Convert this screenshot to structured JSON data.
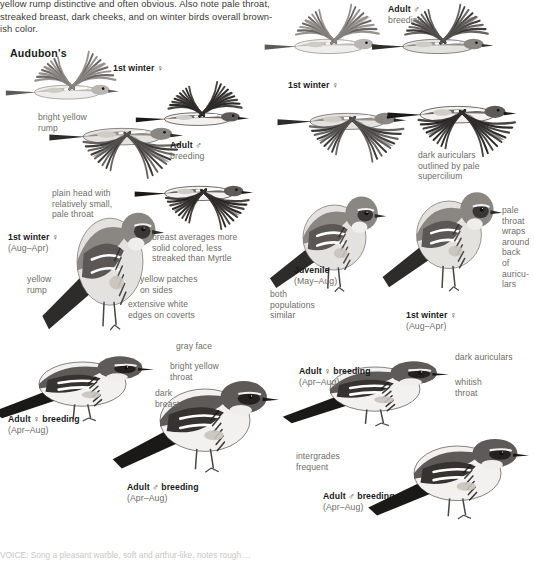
{
  "page": {
    "width": 528,
    "height": 561,
    "background": "#ffffff",
    "ink": "#231f20",
    "label_color": "#6f6c69",
    "heading_color": "#1a1a1a",
    "footer_color": "#c9c7c5"
  },
  "intro": {
    "lines": [
      "yellow rump distinctive and often obvious. Also note pale throat,",
      "streaked breast, dark cheeks, and on winter birds overall brown-",
      "ish color."
    ]
  },
  "headings": [
    {
      "id": "audubons",
      "text": "Audubon's",
      "x": 10,
      "y": 47
    }
  ],
  "labels": [
    {
      "id": "first-winter-female-topleft",
      "bold": "1st winter ♀",
      "sub": "",
      "x": 113,
      "y": 63,
      "style": "bold"
    },
    {
      "id": "bright-yellow-rump",
      "text": "bright yellow\nrump",
      "x": 38,
      "y": 112,
      "style": "plain"
    },
    {
      "id": "adult-male-breeding-left",
      "bold": "Adult ♂",
      "sub": "breeding",
      "x": 170,
      "y": 140,
      "style": "bold"
    },
    {
      "id": "plain-head-note",
      "text": "plain head with\nrelatively small,\npale throat",
      "x": 52,
      "y": 188,
      "style": "plain"
    },
    {
      "id": "first-winter-female-left",
      "bold": "1st winter ♀",
      "sub": "(Aug–Apr)",
      "x": 8,
      "y": 232,
      "style": "bold"
    },
    {
      "id": "breast-averages-note",
      "text": "breast averages more\nsolid colored, less\nstreaked than Myrtle",
      "x": 152,
      "y": 232,
      "style": "plain"
    },
    {
      "id": "yellow-rump-left",
      "text": "yellow\nrump",
      "x": 27,
      "y": 274,
      "style": "plain"
    },
    {
      "id": "yellow-patches-sides",
      "text": "yellow patches\non sides",
      "x": 140,
      "y": 274,
      "style": "plain"
    },
    {
      "id": "extensive-white-edges",
      "text": "extensive white\nedges on coverts",
      "x": 128,
      "y": 299,
      "style": "plain"
    },
    {
      "id": "gray-face",
      "text": "gray face",
      "x": 176,
      "y": 341,
      "style": "plain"
    },
    {
      "id": "bright-yellow-throat",
      "text": "bright yellow\nthroat",
      "x": 170,
      "y": 361,
      "style": "plain"
    },
    {
      "id": "dark-breast",
      "text": "dark\nbreast",
      "x": 155,
      "y": 388,
      "style": "plain"
    },
    {
      "id": "adult-female-breeding-left",
      "bold": "Adult ♀ breeding",
      "sub": "(Apr–Aug)",
      "x": 8,
      "y": 414,
      "style": "bold"
    },
    {
      "id": "adult-male-breeding-bottomleft",
      "bold": "Adult ♂ breeding",
      "sub": "(Apr–Aug)",
      "x": 127,
      "y": 482,
      "style": "bold"
    },
    {
      "id": "adult-male-breeding-topright",
      "bold": "Adult ♂",
      "sub": "breeding",
      "x": 388,
      "y": 4,
      "style": "bold"
    },
    {
      "id": "first-winter-female-right",
      "bold": "1st winter ♀",
      "sub": "",
      "x": 288,
      "y": 80,
      "style": "bold"
    },
    {
      "id": "dark-auriculars-supercilium",
      "text": "dark auriculars\noutlined by pale\nsupercilium",
      "x": 418,
      "y": 150,
      "style": "plain"
    },
    {
      "id": "pale-throat-wraps",
      "text": "pale\nthroat\nwraps\naround\nback of\nauricu-\nlars",
      "x": 502,
      "y": 205,
      "style": "plain"
    },
    {
      "id": "juvenile",
      "bold": "Juvenile",
      "sub": "(May–Aug)",
      "x": 294,
      "y": 265,
      "style": "bold"
    },
    {
      "id": "both-populations-similar",
      "text": "both\npopulations\nsimilar",
      "x": 270,
      "y": 289,
      "style": "plain"
    },
    {
      "id": "first-winter-female-midright",
      "bold": "1st winter ♀",
      "sub": "(Aug–Apr)",
      "x": 406,
      "y": 310,
      "style": "bold"
    },
    {
      "id": "adult-female-breeding-right",
      "bold": "Adult ♀ breeding",
      "sub": "(Apr–Aug)",
      "x": 299,
      "y": 366,
      "style": "bold"
    },
    {
      "id": "dark-auriculars-right",
      "text": "dark auriculars",
      "x": 455,
      "y": 352,
      "style": "plain"
    },
    {
      "id": "whitish-throat",
      "text": "whitish\nthroat",
      "x": 455,
      "y": 377,
      "style": "plain"
    },
    {
      "id": "intergrades-frequent",
      "text": "intergrades\nfrequent",
      "x": 296,
      "y": 451,
      "style": "plain"
    },
    {
      "id": "adult-male-breeding-bottomright",
      "bold": "Adult ♂ breeding",
      "sub": "(Apr–Aug)",
      "x": 323,
      "y": 491,
      "style": "bold"
    }
  ],
  "footer": {
    "text": "VOICE: Song a pleasant warble, soft and arthur-like, notes rough ..."
  },
  "birds": [
    {
      "id": "flying-1st-winter-female-topleft",
      "type": "flying-upwing",
      "x": 30,
      "y": 55,
      "w": 110,
      "h": 60,
      "tone": "pale"
    },
    {
      "id": "flying-1st-winter-female-left",
      "type": "flying-downwing",
      "x": 78,
      "y": 92,
      "w": 130,
      "h": 72,
      "tone": "mid"
    },
    {
      "id": "flying-small-topleft",
      "type": "flying-upwing",
      "x": 160,
      "y": 85,
      "w": 110,
      "h": 55,
      "tone": "dark"
    },
    {
      "id": "flying-adult-male-breeding-left",
      "type": "flying-downwing",
      "x": 160,
      "y": 155,
      "w": 115,
      "h": 62,
      "tone": "dark"
    },
    {
      "id": "flying-1st-winter-female-topright",
      "type": "flying-upwing",
      "x": 290,
      "y": 8,
      "w": 115,
      "h": 62,
      "tone": "pale"
    },
    {
      "id": "flying-adult-male-breeding-right",
      "type": "flying-upwing",
      "x": 398,
      "y": 8,
      "w": 118,
      "h": 62,
      "tone": "mid"
    },
    {
      "id": "flying-1st-winter-female-midright",
      "type": "flying-downwing",
      "x": 305,
      "y": 78,
      "w": 125,
      "h": 70,
      "tone": "mid"
    },
    {
      "id": "flying-adult-male-breeding-midright",
      "type": "flying-downwing",
      "x": 415,
      "y": 70,
      "w": 125,
      "h": 72,
      "tone": "dark"
    },
    {
      "id": "perched-1st-winter-female-left",
      "type": "perched-large",
      "x": 55,
      "y": 195,
      "w": 110,
      "h": 145,
      "tone": "mid"
    },
    {
      "id": "perched-juvenile",
      "type": "perched-medium",
      "x": 282,
      "y": 180,
      "w": 105,
      "h": 125,
      "tone": "mid"
    },
    {
      "id": "perched-1st-winter-female-right",
      "type": "perched-medium",
      "x": 395,
      "y": 175,
      "w": 108,
      "h": 130,
      "tone": "mid"
    },
    {
      "id": "perched-adult-female-breeding-left",
      "type": "perched-side",
      "x": 10,
      "y": 345,
      "w": 145,
      "h": 85,
      "tone": "dark"
    },
    {
      "id": "perched-adult-male-breeding-bottomleft",
      "type": "perched-side",
      "x": 130,
      "y": 365,
      "w": 150,
      "h": 120,
      "tone": "dark"
    },
    {
      "id": "perched-adult-female-breeding-right",
      "type": "perched-side",
      "x": 300,
      "y": 350,
      "w": 150,
      "h": 85,
      "tone": "dark"
    },
    {
      "id": "perched-adult-male-breeding-bottomright",
      "type": "perched-side",
      "x": 385,
      "y": 425,
      "w": 145,
      "h": 105,
      "tone": "dark"
    }
  ]
}
